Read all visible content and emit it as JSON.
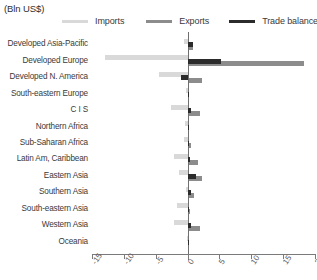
{
  "header": {
    "units": "(Bln US$)"
  },
  "legend": {
    "position": "top",
    "items": [
      {
        "label": "Imports",
        "color": "#d9d9d9",
        "key": "imports"
      },
      {
        "label": "Exports",
        "color": "#8c8c8c",
        "key": "exports"
      },
      {
        "label": "Trade balance",
        "color": "#2b2b2b",
        "key": "balance"
      }
    ]
  },
  "chart_data": {
    "type": "bar",
    "orientation": "horizontal",
    "title": "",
    "subtitle": "",
    "xlabel": "",
    "ylabel": "",
    "units": "(Bln US$)",
    "xlim": [
      -15,
      20
    ],
    "xticks": [
      -15,
      -10,
      -5,
      0,
      5,
      10,
      15,
      20
    ],
    "xticklabels": [
      "-15",
      "-10",
      "-5",
      "0",
      "5",
      "10",
      "15",
      "20"
    ],
    "grid": false,
    "zero_line": true,
    "legend_position": "top",
    "categories": [
      "Developed Asia-Pacific",
      "Developed Europe",
      "Developed N. America",
      "South-eastern Europe",
      "C I S",
      "Northern Africa",
      "Sub-Saharan Africa",
      "Latin Am, Caribbean",
      "Eastern Asia",
      "Southern Asia",
      "South-eastern Asia",
      "Western Asia",
      "Oceania"
    ],
    "series": [
      {
        "name": "Imports",
        "color": "#d9d9d9",
        "values": [
          -0.6,
          -13.0,
          -4.5,
          -0.3,
          -2.6,
          -0.4,
          -0.5,
          -2.1,
          -1.3,
          -0.2,
          -1.6,
          -2.2,
          -0.1
        ]
      },
      {
        "name": "Exports",
        "color": "#8c8c8c",
        "values": [
          0.9,
          18.3,
          2.3,
          0.2,
          1.9,
          0.3,
          0.5,
          1.6,
          2.2,
          1.0,
          0.4,
          1.9,
          0.1
        ]
      },
      {
        "name": "Trade balance",
        "color": "#2b2b2b",
        "values": [
          0.8,
          5.3,
          -1.1,
          0.2,
          0.5,
          0.2,
          0.3,
          0.4,
          1.4,
          0.6,
          0.2,
          0.5,
          0.05
        ]
      }
    ]
  }
}
